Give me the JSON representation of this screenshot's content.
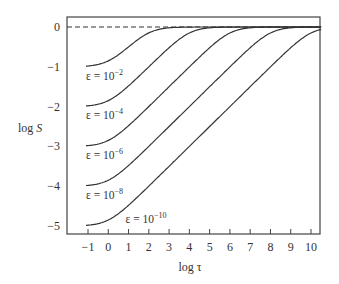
{
  "chart_data": {
    "type": "line",
    "title": "",
    "xlabel": "log τ",
    "ylabel_prefix": "log ",
    "ylabel_var": "S",
    "xlim": [
      -1.5,
      10.5
    ],
    "ylim": [
      -5.25,
      0.25
    ],
    "xticks": [
      -1,
      0,
      1,
      2,
      3,
      4,
      5,
      6,
      7,
      8,
      9,
      10
    ],
    "yticks": [
      0,
      -1,
      -2,
      -3,
      -4,
      -5
    ],
    "grid": false,
    "legend": "none (inline curve labels)",
    "reference_line": {
      "y": 0,
      "style": "dashed"
    },
    "series": [
      {
        "name": "ε = 10^-2",
        "epsilon_exp": -2,
        "label_base": "ε = 10",
        "label_exp": "−2",
        "plateau": -1,
        "label_x": -1.1,
        "label_y": -1.22
      },
      {
        "name": "ε = 10^-4",
        "epsilon_exp": -4,
        "label_base": "ε = 10",
        "label_exp": "−4",
        "plateau": -2,
        "label_x": -1.1,
        "label_y": -2.22
      },
      {
        "name": "ε = 10^-6",
        "epsilon_exp": -6,
        "label_base": "ε = 10",
        "label_exp": "−6",
        "plateau": -3,
        "label_x": -1.1,
        "label_y": -3.22
      },
      {
        "name": "ε = 10^-8",
        "epsilon_exp": -8,
        "label_base": "ε = 10",
        "label_exp": "−8",
        "plateau": -4,
        "label_x": -1.1,
        "label_y": -4.22
      },
      {
        "name": "ε = 10^-10",
        "epsilon_exp": -10,
        "label_base": "ε = 10",
        "label_exp": "−10",
        "plateau": -5,
        "label_x": 0.85,
        "label_y": -4.82
      }
    ],
    "model": "log S = 0.5·log10( ε(1+τ) / (1+ετ) )"
  },
  "colors": {
    "line": "#333333",
    "axis": "#444444",
    "background": "#ffffff"
  }
}
